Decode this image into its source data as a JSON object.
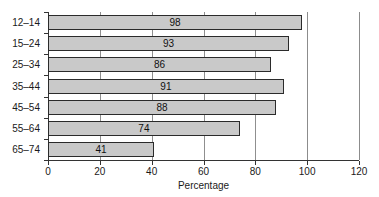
{
  "chart_data": {
    "type": "bar",
    "orientation": "horizontal",
    "title": "",
    "xlabel": "Percentage",
    "ylabel": "",
    "categories": [
      "12–14",
      "15–24",
      "25–34",
      "35–44",
      "45–54",
      "55–64",
      "65–74"
    ],
    "values": [
      98,
      93,
      86,
      91,
      88,
      74,
      41
    ],
    "bar_labels": [
      "98",
      "93",
      "86",
      "91",
      "88",
      "74",
      "41"
    ],
    "xlim": [
      0,
      120
    ],
    "xticks": [
      0,
      20,
      40,
      60,
      80,
      100,
      120
    ],
    "xtick_labels": [
      "0",
      "20",
      "40",
      "60",
      "80",
      "100",
      "120"
    ],
    "grid": "vertical",
    "legend": "none",
    "bar_fill_color": "#c9c9c9",
    "bar_edge_color": "#2b2b2b",
    "axis_color": "#333333",
    "gridline_color": "#8c8c8c",
    "background_color": "#ffffff"
  }
}
